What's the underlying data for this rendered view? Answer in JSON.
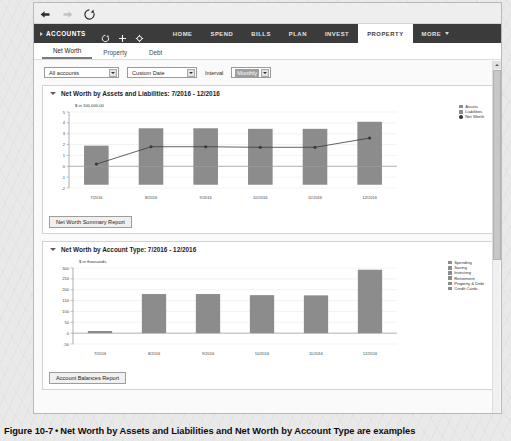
{
  "browser": {
    "back_icon": "back-arrow-icon",
    "forward_icon": "forward-arrow-icon",
    "reload_icon": "reload-icon"
  },
  "appbar": {
    "accounts_label": "ACCOUNTS",
    "tools": [
      "refresh-icon",
      "add-icon",
      "settings-icon"
    ],
    "nav": [
      {
        "label": "HOME",
        "active": false
      },
      {
        "label": "SPEND",
        "active": false
      },
      {
        "label": "BILLS",
        "active": false
      },
      {
        "label": "PLAN",
        "active": false
      },
      {
        "label": "INVEST",
        "active": false
      },
      {
        "label": "PROPERTY",
        "active": true
      },
      {
        "label": "MORE",
        "active": false,
        "has_caret": true
      }
    ]
  },
  "subtabs": [
    {
      "label": "Net Worth",
      "active": true
    },
    {
      "label": "Property",
      "active": false
    },
    {
      "label": "Debt",
      "active": false
    }
  ],
  "filters": {
    "accounts_value": "All accounts",
    "date_value": "Custom Date",
    "interval_label": "Interval",
    "interval_value": "Monthly"
  },
  "panel1": {
    "title": "Net Worth by Assets and Liabilities: 7/2016 - 12/2016",
    "button_label": "Net Worth Summary Report"
  },
  "panel2": {
    "title": "Net Worth by Account Type: 7/2016 - 12/2016",
    "button_label": "Account Balances Report"
  },
  "caption": {
    "figure": "Figure 10-7",
    "separator": "•",
    "text": "Net Worth by Assets and Liabilities and Net Worth by Account Type are examples"
  },
  "colors": {
    "appbar": "#3b3b3b",
    "bar_gray": "#8c8c8c",
    "line_dark": "#3a3a3a",
    "axis": "#9a9a9a",
    "grid": "#e2e2e2"
  },
  "chart_data": [
    {
      "type": "bar",
      "title": "Net Worth by Assets and Liabilities: 7/2016 - 12/2016",
      "xlabel": "",
      "ylabel": "$ in 100,000.00",
      "categories": [
        "7/2016",
        "8/2016",
        "9/2016",
        "10/2016",
        "11/2016",
        "12/2016"
      ],
      "ylim": [
        -2,
        5
      ],
      "yticks": [
        5,
        4,
        3,
        2,
        1,
        0,
        -1,
        -2
      ],
      "grid": true,
      "legend_position": "right",
      "series": [
        {
          "name": "Assets",
          "type": "bar",
          "color": "#8c8c8c",
          "values": [
            1.9,
            3.5,
            3.5,
            3.45,
            3.45,
            4.1
          ]
        },
        {
          "name": "Liabilities",
          "type": "bar",
          "color": "#8c8c8c",
          "values": [
            -1.7,
            -1.7,
            -1.7,
            -1.7,
            -1.7,
            -1.7
          ]
        },
        {
          "name": "Net Worth",
          "type": "line",
          "color": "#3a3a3a",
          "values": [
            0.2,
            1.8,
            1.8,
            1.75,
            1.75,
            2.6
          ]
        }
      ]
    },
    {
      "type": "bar",
      "title": "Net Worth by Account Type: 7/2016 - 12/2016",
      "xlabel": "",
      "ylabel": "$ in thousands",
      "categories": [
        "7/2016",
        "8/2016",
        "9/2016",
        "10/2016",
        "11/2016",
        "12/2016"
      ],
      "ylim": [
        -50,
        300
      ],
      "yticks": [
        300,
        250,
        200,
        150,
        100,
        50,
        0,
        -50
      ],
      "grid": true,
      "legend_position": "right",
      "legend_entries": [
        "Spending",
        "Saving",
        "Investing",
        "Retirement",
        "Property & Debt",
        "Credit Cards"
      ],
      "series": [
        {
          "name": "Total by Account Type",
          "type": "bar",
          "color": "#8c8c8c",
          "values": [
            10,
            180,
            180,
            175,
            174,
            292
          ]
        }
      ]
    }
  ]
}
